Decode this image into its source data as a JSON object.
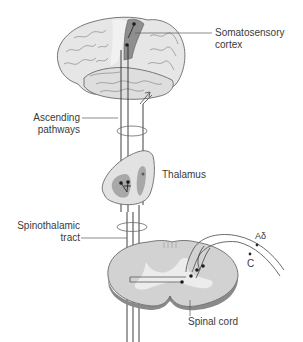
{
  "figure": {
    "colors": {
      "background": "#ffffff",
      "tissue_light": "#e2e2e2",
      "tissue_mid": "#c8c8c8",
      "tissue_dark": "#8e8e8e",
      "outline": "#5a5a5a",
      "pathway_line": "#2b2b2b",
      "text": "#3a3a3a"
    }
  },
  "labels": {
    "somatosensory_cortex": [
      "Somatosensory",
      "cortex"
    ],
    "ascending_pathways": [
      "Ascending",
      "pathways"
    ],
    "thalamus": "Thalamus",
    "spinothalamic_tract": [
      "Spinothalamic",
      "tract"
    ],
    "spinal_cord": "Spinal cord",
    "fiber_a_delta": "Aδ",
    "fiber_c": "C"
  },
  "structures": [
    {
      "name": "Brain (cerebral cortex, lateral view)",
      "role": "top"
    },
    {
      "name": "Thalamus",
      "role": "relay"
    },
    {
      "name": "Spinal cord (cross-section)",
      "role": "entry"
    }
  ],
  "fibers": [
    {
      "name": "Aδ",
      "type": "afferent fiber"
    },
    {
      "name": "C",
      "type": "afferent fiber"
    }
  ]
}
